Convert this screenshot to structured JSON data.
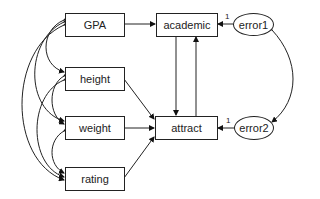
{
  "diagram": {
    "type": "path-diagram",
    "observed": [
      {
        "id": "gpa",
        "label": "GPA"
      },
      {
        "id": "height",
        "label": "height"
      },
      {
        "id": "weight",
        "label": "weight"
      },
      {
        "id": "rating",
        "label": "rating"
      },
      {
        "id": "academic",
        "label": "academic"
      },
      {
        "id": "attract",
        "label": "attract"
      }
    ],
    "errors": [
      {
        "id": "error1",
        "label": "error1"
      },
      {
        "id": "error2",
        "label": "error2"
      }
    ],
    "paths": [
      {
        "from": "GPA",
        "to": "academic"
      },
      {
        "from": "height",
        "to": "attract"
      },
      {
        "from": "weight",
        "to": "attract"
      },
      {
        "from": "rating",
        "to": "attract"
      },
      {
        "from": "academic",
        "to": "attract"
      },
      {
        "from": "attract",
        "to": "academic"
      },
      {
        "from": "error1",
        "to": "academic",
        "weight": "1"
      },
      {
        "from": "error2",
        "to": "attract",
        "weight": "1"
      }
    ],
    "covariances": [
      [
        "GPA",
        "height"
      ],
      [
        "GPA",
        "weight"
      ],
      [
        "GPA",
        "rating"
      ],
      [
        "height",
        "weight"
      ],
      [
        "height",
        "rating"
      ],
      [
        "weight",
        "rating"
      ],
      [
        "error1",
        "error2"
      ]
    ],
    "fixed_weight_label": "1"
  }
}
